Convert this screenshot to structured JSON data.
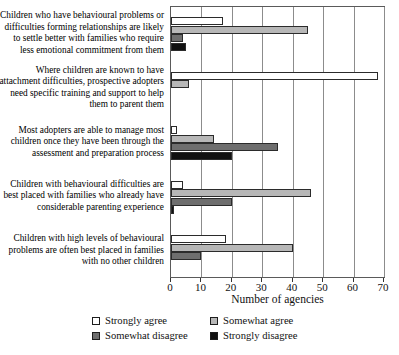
{
  "chart_data": {
    "type": "bar",
    "orientation": "horizontal",
    "title": "",
    "xlabel": "Number of agencies",
    "ylabel": "",
    "xlim": [
      0,
      70
    ],
    "xticks": [
      0,
      10,
      20,
      30,
      40,
      50,
      60,
      70
    ],
    "grid": true,
    "legend_position": "bottom",
    "categories": [
      "Children who have behavioural problems or difficulties forming relationships are likely to settle better with families who require less emotional commitment from them",
      "Where children are known to have attachment difficulties, prospective adopters need specific training and support to help them to parent them",
      "Most adopters are able to manage most children once they have been through the assessment and preparation process",
      "Children with behavioural difficulties are best placed with families who already have considerable parenting experience",
      "Children with high levels of behavioural problems are often best placed in families with no other children"
    ],
    "series": [
      {
        "name": "Strongly agree",
        "color": "#ffffff",
        "values": [
          17,
          68,
          2,
          4,
          18
        ]
      },
      {
        "name": "Somewhat agree",
        "color": "#b7b7b7",
        "values": [
          45,
          6,
          14,
          46,
          40
        ]
      },
      {
        "name": "Somewhat disagree",
        "color": "#6e6e6e",
        "values": [
          4,
          0,
          35,
          20,
          10
        ]
      },
      {
        "name": "Strongly disagree",
        "color": "#111111",
        "values": [
          5,
          0,
          20,
          1,
          0
        ]
      }
    ]
  },
  "axis": {
    "x_title": "Number of agencies",
    "tick_labels": [
      "0",
      "10",
      "20",
      "30",
      "40",
      "50",
      "60",
      "70"
    ]
  },
  "legend": {
    "items": [
      {
        "label": "Strongly agree"
      },
      {
        "label": "Somewhat agree"
      },
      {
        "label": "Somewhat disagree"
      },
      {
        "label": "Strongly disagree"
      }
    ]
  }
}
